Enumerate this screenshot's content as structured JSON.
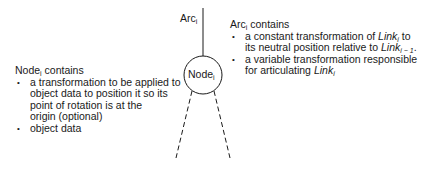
{
  "diagram": {
    "arc_label": {
      "base": "Arc",
      "sub": "i"
    },
    "node_label": {
      "base": "Node",
      "sub": "i"
    },
    "stroke_color": "#1a1a1a",
    "background": "#ffffff"
  },
  "node_info": {
    "heading_base": "Node",
    "heading_sub": "i",
    "heading_rest": " contains",
    "bullets": [
      {
        "lines": [
          "a transformation to be applied to",
          "object data to position it so its",
          "point of rotation is at the",
          "origin (optional)"
        ]
      },
      {
        "lines": [
          "object data"
        ]
      }
    ]
  },
  "arc_info": {
    "heading_base": "Arc",
    "heading_sub": "i",
    "heading_rest": " contains",
    "bullet1": {
      "pre": "a constant transformation of ",
      "link1_base": "Link",
      "link1_sub": "i",
      "mid": " to",
      "line2_pre": "its neutral position relative to ",
      "link2_base": "Link",
      "link2_sub": "i − 1",
      "end": "."
    },
    "bullet2": {
      "line1": "a variable transformation responsible",
      "line2_pre": "for articulating ",
      "link_base": "Link",
      "link_sub": "i"
    }
  }
}
